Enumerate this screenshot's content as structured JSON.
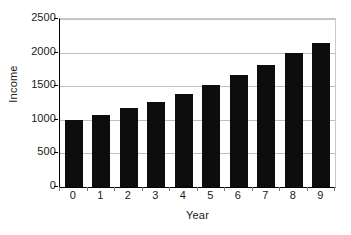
{
  "chart_data": {
    "type": "bar",
    "title": "",
    "xlabel": "Year",
    "ylabel": "Income",
    "categories": [
      "0",
      "1",
      "2",
      "3",
      "4",
      "5",
      "6",
      "7",
      "8",
      "9"
    ],
    "values": [
      990,
      1075,
      1170,
      1270,
      1390,
      1520,
      1660,
      1820,
      1990,
      2150
    ],
    "series": [
      {
        "name": "Income",
        "values": [
          990,
          1075,
          1170,
          1270,
          1390,
          1520,
          1660,
          1820,
          1990,
          2150
        ]
      }
    ],
    "ylim": [
      0,
      2500
    ],
    "y_ticks": [
      0,
      500,
      1000,
      1500,
      2000,
      2500
    ],
    "y_ticklabels": [
      "0",
      "500",
      "1000",
      "1500",
      "2000",
      "2500"
    ],
    "x_ticklabels": [
      "0",
      "1",
      "2",
      "3",
      "4",
      "5",
      "6",
      "7",
      "8",
      "9"
    ],
    "grid": true,
    "grid_axis": "y",
    "legend": false,
    "legend_position": "none",
    "bar_color": "#0d0d0d",
    "grid_color": "#c0c0c0",
    "axis_color": "#000000",
    "background_color": "#ffffff"
  }
}
